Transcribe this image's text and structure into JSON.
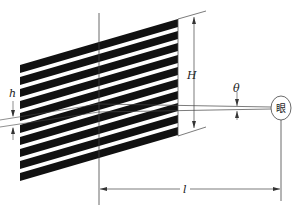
{
  "diagram": {
    "type": "optical grating viewing geometry",
    "stripe_count": 10,
    "colors": {
      "stripe": "#111111",
      "line": "#444444",
      "background": "#ffffff"
    },
    "labels": {
      "h": "h",
      "H": "H",
      "theta": "θ",
      "l": "l",
      "eye": "眼"
    }
  }
}
